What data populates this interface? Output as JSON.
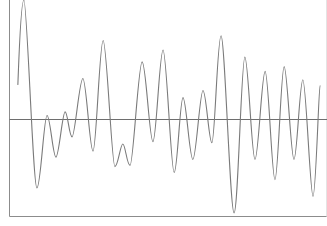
{
  "chart_data": {
    "type": "line",
    "title": "",
    "xlabel": "",
    "ylabel": "",
    "grid": false,
    "legend": null,
    "xlim": [
      0,
      100
    ],
    "ylim": [
      -0.815,
      1.0
    ],
    "baseline": 0,
    "series": [
      {
        "name": "waveform",
        "color": "#7a7a7a",
        "x": [
          2.8,
          4.7,
          8.8,
          12.0,
          14.8,
          17.7,
          19.9,
          23.3,
          26.5,
          29.7,
          33.4,
          35.9,
          38.2,
          42.0,
          45.4,
          48.6,
          52.1,
          54.9,
          58.0,
          61.2,
          64.0,
          66.9,
          71.0,
          74.4,
          77.6,
          80.8,
          83.9,
          86.8,
          89.9,
          92.7,
          95.9,
          98.1
        ],
        "values": [
          0.29,
          1.0,
          -0.58,
          0.03,
          -0.32,
          0.06,
          -0.15,
          0.34,
          -0.27,
          0.66,
          -0.4,
          -0.21,
          -0.39,
          0.48,
          -0.19,
          0.58,
          -0.45,
          0.18,
          -0.34,
          0.24,
          -0.2,
          0.7,
          -0.79,
          0.52,
          -0.34,
          0.4,
          -0.51,
          0.44,
          -0.34,
          0.33,
          -0.65,
          0.28
        ]
      }
    ]
  },
  "style": {
    "axis_color": "#8c8c8c",
    "baseline_color": "#6e6e6e",
    "line_color": "#7a7a7a",
    "background": "#ffffff"
  }
}
